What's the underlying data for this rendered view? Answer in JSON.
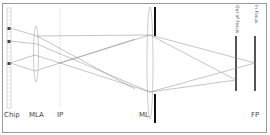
{
  "diagram": {
    "type": "optical ray diagram",
    "labels": {
      "chip": "Chip",
      "mla": "MLA",
      "ip": "IP",
      "ml": "ML",
      "fp": "FP",
      "out_of_focus": "Out of Focus",
      "in_focus": "In Focus"
    },
    "colors": {
      "frame": "#9a9a9a",
      "rays": "#8a8a8a",
      "aperture": "#111111",
      "sensor_bar": "#555555",
      "lens_outline": "#aaaaaa",
      "chip_pixel_active": "#444444"
    }
  }
}
